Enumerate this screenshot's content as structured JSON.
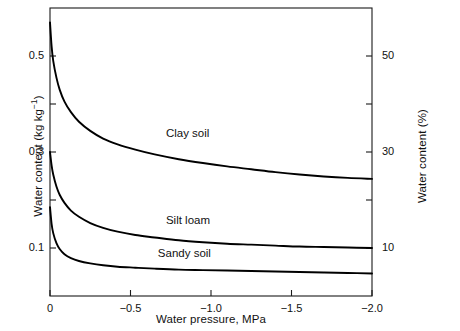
{
  "chart_data": {
    "type": "line",
    "title": "",
    "xlabel": "Water pressure, MPa",
    "ylabel": "Water content (kg kg−1)",
    "ylabel_right": "Water content (%)",
    "xlim": [
      0,
      -2.0
    ],
    "ylim": [
      0.0,
      0.6
    ],
    "ylim_right": [
      0,
      60
    ],
    "grid": false,
    "legend_position": "inline-annotations",
    "x_ticks": [
      {
        "value": 0,
        "label": "0"
      },
      {
        "value": -0.5,
        "label": "−0.5"
      },
      {
        "value": -1.0,
        "label": "−1.0"
      },
      {
        "value": -1.5,
        "label": "−1.5"
      },
      {
        "value": -2.0,
        "label": "−2.0"
      }
    ],
    "y_ticks_left": [
      {
        "value": 0.1,
        "label": "0.1"
      },
      {
        "value": 0.2,
        "label": ""
      },
      {
        "value": 0.3,
        "label": "0.3"
      },
      {
        "value": 0.4,
        "label": ""
      },
      {
        "value": 0.5,
        "label": "0.5"
      }
    ],
    "y_ticks_right": [
      {
        "value": 10,
        "label": "10"
      },
      {
        "value": 20,
        "label": ""
      },
      {
        "value": 30,
        "label": "30"
      },
      {
        "value": 40,
        "label": ""
      },
      {
        "value": 50,
        "label": "50"
      }
    ],
    "series": [
      {
        "name": "Clay soil",
        "annotation": "Clay soil",
        "color": "#000000",
        "x": [
          0.0,
          -0.01,
          -0.02,
          -0.04,
          -0.06,
          -0.09,
          -0.13,
          -0.18,
          -0.25,
          -0.33,
          -0.42,
          -0.53,
          -0.65,
          -0.8,
          -0.95,
          -1.1,
          -1.25,
          -1.4,
          -1.55,
          -1.7,
          -1.85,
          -2.0
        ],
        "y": [
          0.57,
          0.52,
          0.49,
          0.455,
          0.43,
          0.405,
          0.383,
          0.363,
          0.344,
          0.328,
          0.316,
          0.305,
          0.295,
          0.285,
          0.277,
          0.27,
          0.264,
          0.258,
          0.253,
          0.249,
          0.246,
          0.244
        ]
      },
      {
        "name": "Silt loam",
        "annotation": "Silt loam",
        "color": "#000000",
        "x": [
          0.0,
          -0.01,
          -0.02,
          -0.04,
          -0.06,
          -0.09,
          -0.13,
          -0.18,
          -0.25,
          -0.33,
          -0.42,
          -0.53,
          -0.65,
          -0.8,
          -0.95,
          -1.1,
          -1.25,
          -1.4,
          -1.55,
          -1.7,
          -1.85,
          -2.0
        ],
        "y": [
          0.3,
          0.272,
          0.253,
          0.228,
          0.211,
          0.194,
          0.178,
          0.165,
          0.152,
          0.142,
          0.134,
          0.127,
          0.122,
          0.116,
          0.112,
          0.109,
          0.107,
          0.105,
          0.103,
          0.102,
          0.101,
          0.1
        ]
      },
      {
        "name": "Sandy soil",
        "annotation": "Sandy soil",
        "color": "#000000",
        "x": [
          0.0,
          -0.01,
          -0.02,
          -0.04,
          -0.06,
          -0.09,
          -0.13,
          -0.18,
          -0.25,
          -0.33,
          -0.42,
          -0.53,
          -0.65,
          -0.8,
          -0.95,
          -1.1,
          -1.25,
          -1.4,
          -1.55,
          -1.7,
          -1.85,
          -2.0
        ],
        "y": [
          0.185,
          0.15,
          0.131,
          0.11,
          0.098,
          0.087,
          0.079,
          0.073,
          0.068,
          0.064,
          0.061,
          0.059,
          0.057,
          0.055,
          0.054,
          0.053,
          0.052,
          0.051,
          0.05,
          0.049,
          0.048,
          0.047
        ]
      }
    ],
    "annotations": [
      {
        "text": "Clay soil",
        "x": -0.72,
        "y": 0.335
      },
      {
        "text": "Silt loam",
        "x": -0.72,
        "y": 0.155
      },
      {
        "text": "Sandy soil",
        "x": -0.67,
        "y": 0.085
      }
    ]
  }
}
